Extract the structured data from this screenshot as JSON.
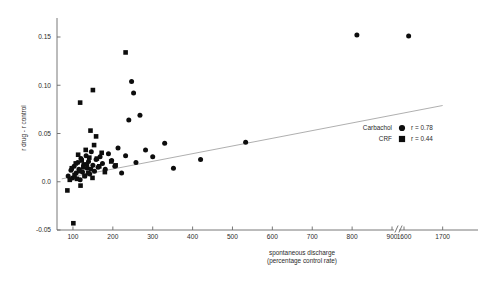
{
  "chart_data": {
    "type": "scatter",
    "title": "",
    "xlabel": "spontaneous discharge (percentage control rate)",
    "xlabel_line1": "spontaneous discharge",
    "xlabel_line2": "(percentage control rate)",
    "ylabel": "r drug - r control",
    "xlim": [
      60,
      1750
    ],
    "ylim": [
      -0.05,
      0.17
    ],
    "grid": false,
    "axis_break": {
      "after": 900,
      "before": 1600,
      "symbol": "//"
    },
    "xticks": [
      100,
      200,
      300,
      400,
      500,
      600,
      700,
      800,
      900,
      1600,
      1700
    ],
    "xtick_labels": [
      "100",
      "200",
      "300",
      "400",
      "500",
      "600",
      "700",
      "800",
      "900",
      "1600",
      "1700"
    ],
    "yticks": [
      -0.05,
      0.0,
      0.05,
      0.1,
      0.15
    ],
    "ytick_labels": [
      "-0.05",
      "0.0",
      "0.05",
      "0.10",
      "0.15"
    ],
    "legend_position": "right-middle",
    "series": [
      {
        "name": "Carbachol",
        "marker": "circle",
        "r": "r = 0.78",
        "r_value": 0.78,
        "points": [
          [
            88,
            0.006
          ],
          [
            95,
            0.012
          ],
          [
            99,
            0.004
          ],
          [
            103,
            0.016
          ],
          [
            108,
            0.009
          ],
          [
            112,
            0.02
          ],
          [
            115,
            0.013
          ],
          [
            118,
            0.002
          ],
          [
            120,
            0.024
          ],
          [
            124,
            0.01
          ],
          [
            127,
            0.018
          ],
          [
            130,
            0.006
          ],
          [
            133,
            0.027
          ],
          [
            136,
            0.014
          ],
          [
            139,
            0.021
          ],
          [
            142,
            0.008
          ],
          [
            146,
            0.031
          ],
          [
            150,
            0.017
          ],
          [
            154,
            0.011
          ],
          [
            158,
            0.023
          ],
          [
            163,
            0.015
          ],
          [
            168,
            0.026
          ],
          [
            174,
            0.019
          ],
          [
            181,
            0.013
          ],
          [
            189,
            0.029
          ],
          [
            197,
            0.022
          ],
          [
            205,
            0.016
          ],
          [
            213,
            0.035
          ],
          [
            222,
            0.009
          ],
          [
            232,
            0.027
          ],
          [
            240,
            0.064
          ],
          [
            247,
            0.104
          ],
          [
            252,
            0.092
          ],
          [
            258,
            0.02
          ],
          [
            268,
            0.069
          ],
          [
            282,
            0.033
          ],
          [
            300,
            0.026
          ],
          [
            330,
            0.04
          ],
          [
            352,
            0.014
          ],
          [
            420,
            0.023
          ],
          [
            533,
            0.041
          ],
          [
            812,
            0.152
          ],
          [
            1612,
            0.151
          ]
        ]
      },
      {
        "name": "CRF",
        "marker": "square",
        "r": "r = 0.44",
        "r_value": 0.44,
        "points": [
          [
            86,
            -0.009
          ],
          [
            92,
            0.002
          ],
          [
            97,
            0.014
          ],
          [
            101,
            -0.043
          ],
          [
            104,
            0.007
          ],
          [
            107,
            0.019
          ],
          [
            110,
            0.003
          ],
          [
            113,
            0.028
          ],
          [
            116,
            0.011
          ],
          [
            119,
            -0.004
          ],
          [
            122,
            0.022
          ],
          [
            126,
            0.015
          ],
          [
            129,
            0.006
          ],
          [
            132,
            0.033
          ],
          [
            135,
            0.018
          ],
          [
            138,
            0.009
          ],
          [
            141,
            0.025
          ],
          [
            145,
            0.013
          ],
          [
            149,
            0.004
          ],
          [
            153,
            0.038
          ],
          [
            118,
            0.082
          ],
          [
            144,
            0.053
          ],
          [
            150,
            0.095
          ],
          [
            158,
            0.047
          ],
          [
            160,
            0.024
          ],
          [
            166,
            0.016
          ],
          [
            172,
            0.03
          ],
          [
            180,
            0.01
          ],
          [
            196,
            0.021
          ],
          [
            207,
            0.017
          ],
          [
            232,
            0.134
          ]
        ]
      }
    ],
    "regression_line": {
      "x0": 72,
      "y0": 0.003,
      "x1": 1700,
      "y1": 0.079,
      "color": "#9a9a9a"
    }
  },
  "legend": {
    "rows": [
      {
        "label": "Carbachol",
        "marker": "circle",
        "r": "r = 0.78"
      },
      {
        "label": "CRF",
        "marker": "square",
        "r": "r = 0.44"
      }
    ]
  },
  "colors": {
    "marker": "#0d0d0d",
    "axis": "#6a6a6a",
    "regression": "#9a9a9a",
    "background": "#ffffff"
  }
}
